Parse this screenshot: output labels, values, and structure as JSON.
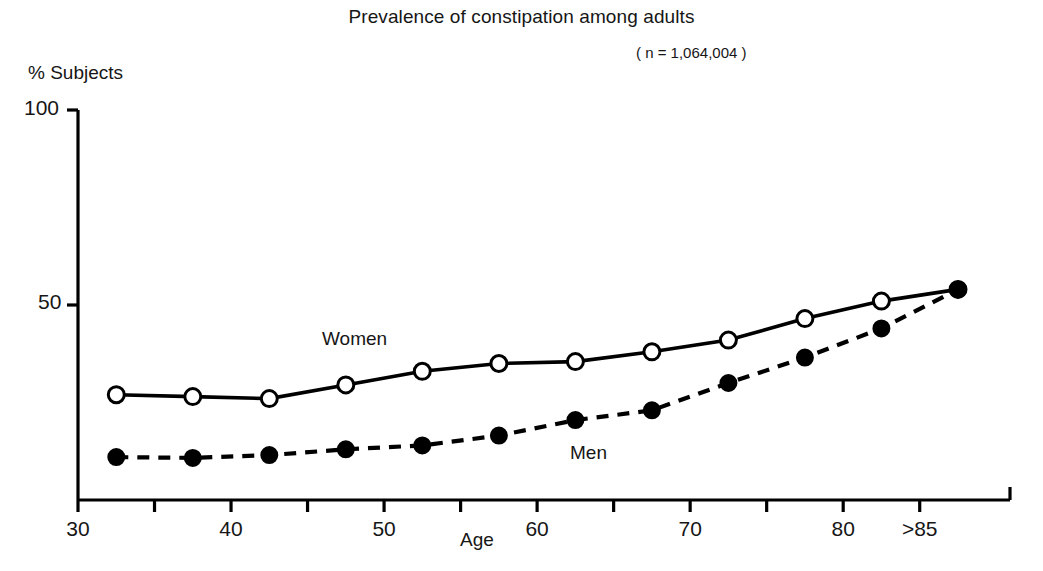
{
  "chart_data": {
    "type": "line",
    "title": "Prevalence of constipation among adults",
    "subtitle": "( n = 1,064,004 )",
    "xlabel": "Age",
    "ylabel": "% Subjects",
    "grid": false,
    "legend_position": "inline-annotations",
    "xlim": [
      30,
      87.5
    ],
    "ylim": [
      0,
      100
    ],
    "yticks": [
      0,
      50,
      100
    ],
    "ytick_labels": [
      "",
      "50",
      "100"
    ],
    "xticks": [
      30,
      35,
      40,
      45,
      50,
      55,
      60,
      65,
      70,
      75,
      80,
      85
    ],
    "xtick_labels": [
      "30",
      "",
      "40",
      "",
      "50",
      "",
      "60",
      "",
      "70",
      "",
      "80",
      ">85"
    ],
    "x": [
      32.5,
      37.5,
      42.5,
      47.5,
      52.5,
      57.5,
      62.5,
      67.5,
      72.5,
      77.5,
      82.5,
      87.5
    ],
    "series": [
      {
        "name": "Women",
        "marker": "open-circle",
        "line_style": "solid",
        "color": "#000000",
        "values": [
          27,
          26.5,
          26,
          29.5,
          33,
          35,
          35.5,
          38,
          41,
          46.5,
          51,
          54
        ]
      },
      {
        "name": "Men",
        "marker": "filled-circle",
        "line_style": "dashed",
        "color": "#000000",
        "values": [
          11,
          10.8,
          11.5,
          13,
          14,
          16.5,
          20.5,
          23,
          30,
          36.5,
          44,
          54
        ]
      }
    ]
  },
  "annotations": [
    {
      "label": "Women",
      "x": 47.5,
      "y": 44
    },
    {
      "label": "Men",
      "x": 62.5,
      "y": 15
    }
  ]
}
